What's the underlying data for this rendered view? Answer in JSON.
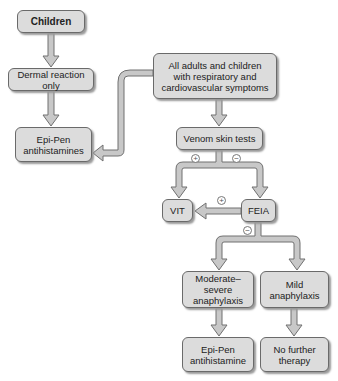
{
  "diagram": {
    "nodes": {
      "children": "Children",
      "dermal": "Dermal reaction only",
      "epipen_left_1": "Epi-Pen",
      "epipen_left_2": "antihistamines",
      "adults_1": "All adults and children",
      "adults_2": "with respiratory and",
      "adults_3": "cardiovascular symptoms",
      "venom": "Venom skin tests",
      "vit": "VIT",
      "feia": "FEIA",
      "modsev_1": "Moderate–severe",
      "modsev_2": "anaphylaxis",
      "mild_1": "Mild",
      "mild_2": "anaphylaxis",
      "epipen_right_1": "Epi-Pen",
      "epipen_right_2": "antihistamine",
      "nofurther_1": "No further",
      "nofurther_2": "therapy"
    },
    "signs": {
      "venom_positive": "+",
      "venom_negative": "−",
      "feia_positive": "+",
      "feia_negative": "−"
    },
    "edges": [
      {
        "from": "children",
        "to": "dermal"
      },
      {
        "from": "dermal",
        "to": "epipen_left"
      },
      {
        "from": "adults",
        "to": "epipen_left"
      },
      {
        "from": "adults",
        "to": "venom"
      },
      {
        "from": "venom",
        "to": "vit",
        "label": "+"
      },
      {
        "from": "venom",
        "to": "feia",
        "label": "−"
      },
      {
        "from": "feia",
        "to": "vit",
        "label": "+"
      },
      {
        "from": "feia",
        "to": "modsev",
        "label": "−"
      },
      {
        "from": "feia",
        "to": "mild",
        "label": "−"
      },
      {
        "from": "modsev",
        "to": "epipen_right"
      },
      {
        "from": "mild",
        "to": "nofurther"
      }
    ],
    "colors": {
      "box_fill": "#dcdcdc",
      "box_border": "#6a6a6a",
      "arrow_fill": "#c8c8c8",
      "arrow_stroke": "#707070"
    }
  }
}
